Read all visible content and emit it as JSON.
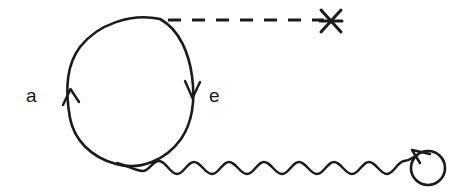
{
  "figure": {
    "kind": "feynman-diagram",
    "width": 464,
    "height": 196,
    "background_color": "#ffffff",
    "ink_color": "#1a1a1a",
    "labels": {
      "left_label": "a",
      "right_label": "e"
    },
    "elements": {
      "fermion_loop": {
        "name": "electron-loop",
        "description": "closed oval fermion loop",
        "center_x": 130,
        "center_y": 92,
        "radius_x": 62,
        "radius_y": 73
      },
      "left_arrow": {
        "name": "left-arrow-up",
        "direction": "up",
        "x": 70,
        "y": 95
      },
      "right_arrow": {
        "name": "right-arrow-down",
        "direction": "down",
        "x": 192,
        "y": 92
      },
      "dashed_line": {
        "name": "dashed-propagator",
        "x1": 168,
        "y1": 20,
        "x2": 322,
        "y2": 20
      },
      "cross_mark": {
        "name": "cross-vertex",
        "x": 331,
        "y": 21,
        "points": 6
      },
      "photon_wave": {
        "name": "photon-propagator",
        "x_start": 140,
        "x_end": 411,
        "y_center": 168,
        "amplitude": 6,
        "period": 23
      },
      "photon_circle": {
        "name": "photon-end-loop",
        "center_x": 428,
        "center_y": 168,
        "radius": 17,
        "arrow_direction": "counter-clockwise"
      }
    }
  }
}
